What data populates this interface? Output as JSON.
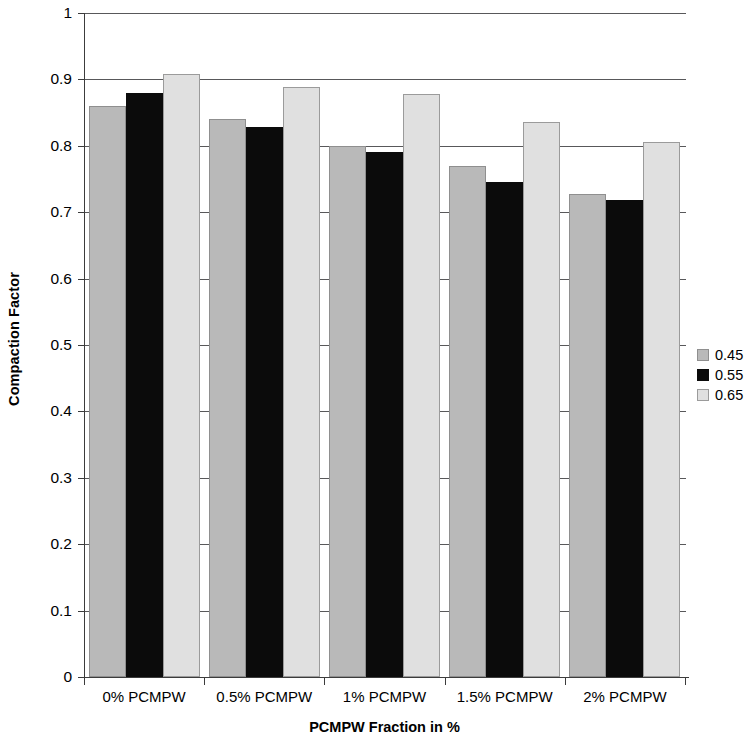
{
  "chart_data": {
    "type": "bar",
    "title": "",
    "xlabel": "PCMPW Fraction in %",
    "ylabel": "Compaction Factor",
    "categories": [
      "0% PCMPW",
      "0.5% PCMPW",
      "1% PCMPW",
      "1.5% PCMPW",
      "2% PCMPW"
    ],
    "series": [
      {
        "name": "0.45",
        "color": "#b9b9b9",
        "values": [
          0.86,
          0.84,
          0.8,
          0.77,
          0.728
        ]
      },
      {
        "name": "0.55",
        "color": "#0b0b0b",
        "values": [
          0.88,
          0.828,
          0.79,
          0.746,
          0.718
        ]
      },
      {
        "name": "0.65",
        "color": "#e0e0e0",
        "values": [
          0.908,
          0.889,
          0.878,
          0.836,
          0.806
        ]
      }
    ],
    "ylim": [
      0,
      1
    ],
    "ytick_labels": [
      "0",
      "0.1",
      "0.2",
      "0.3",
      "0.4",
      "0.5",
      "0.6",
      "0.7",
      "0.8",
      "0.9",
      "1"
    ],
    "ytick_values": [
      0,
      0.1,
      0.2,
      0.3,
      0.4,
      0.5,
      0.6,
      0.7,
      0.8,
      0.9,
      1
    ],
    "grid": "horizontal",
    "legend_position": "right",
    "legend_entries": [
      "0.45",
      "0.55",
      "0.65"
    ]
  }
}
